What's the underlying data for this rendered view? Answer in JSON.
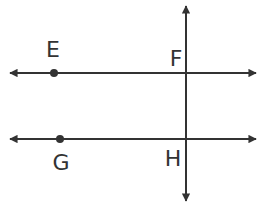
{
  "diagram": {
    "type": "geometry-lines",
    "stroke_color": "#333333",
    "lines": [
      {
        "id": "line-EF",
        "orientation": "horizontal",
        "y": 73,
        "x1": 8,
        "x2": 258,
        "arrows": "both"
      },
      {
        "id": "line-GH",
        "orientation": "horizontal",
        "y": 139,
        "x1": 8,
        "x2": 258,
        "arrows": "both"
      },
      {
        "id": "transversal",
        "orientation": "vertical",
        "x": 186,
        "y1": 4,
        "y2": 203,
        "arrows": "both"
      }
    ],
    "points": [
      {
        "id": "E",
        "x": 54,
        "y": 73,
        "dot": true
      },
      {
        "id": "G",
        "x": 60,
        "y": 139,
        "dot": true
      }
    ],
    "labels": [
      {
        "text": "E",
        "x": 53,
        "y": 57
      },
      {
        "text": "F",
        "x": 176,
        "y": 66
      },
      {
        "text": "G",
        "x": 61,
        "y": 170
      },
      {
        "text": "H",
        "x": 173,
        "y": 166
      }
    ]
  }
}
